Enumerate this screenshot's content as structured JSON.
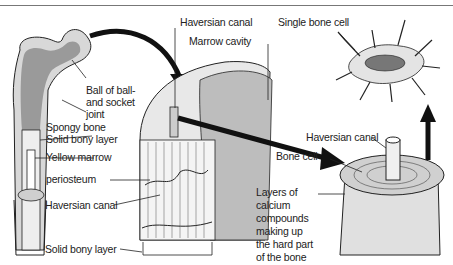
{
  "figure": {
    "title_partial": "...the skeletal system (cut off)",
    "labels": {
      "ball_joint": [
        "Ball of ball-",
        "and socket",
        "joint"
      ],
      "spongy_bone": "Spongy bone",
      "solid_bony_layer_top": "Solid bony layer",
      "yellow_marrow": "Yellow marrow",
      "periosteum": "periosteum",
      "haversian_canal_left": "Haversian canal",
      "solid_bony_layer_bottom": "Solid bony layer",
      "haversian_canal_top": "Haversian canal",
      "marrow_cavity": "Marrow cavity",
      "single_bone_cell": "Single bone cell",
      "haversian_canal_right": "Haversian canal",
      "bone_cell": "Bone cell",
      "calcium_layers": [
        "Layers of",
        "calcium",
        "compounds",
        "making up",
        "the hard part",
        "of the bone"
      ]
    },
    "colors": {
      "ink": "#222222",
      "paper": "#ffffff",
      "shade": "#bfbfbf",
      "rule": "#777777"
    }
  }
}
